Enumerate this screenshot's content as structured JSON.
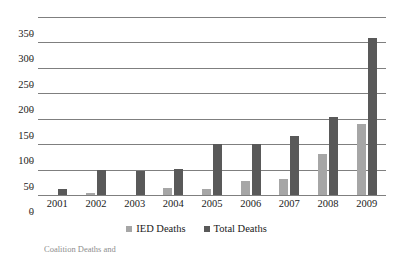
{
  "chart_data": {
    "type": "bar",
    "title": "",
    "subtitle": "",
    "xlabel": "",
    "ylabel": "",
    "categories": [
      "2001",
      "2002",
      "2003",
      "2004",
      "2005",
      "2006",
      "2007",
      "2008",
      "2009"
    ],
    "series": [
      {
        "name": "IED Deaths",
        "color": "#a6a6a6",
        "values": [
          0,
          3,
          0,
          14,
          12,
          28,
          32,
          81,
          139
        ]
      },
      {
        "name": "Total Deaths",
        "color": "#595959",
        "values": [
          12,
          49,
          48,
          52,
          100,
          100,
          117,
          154,
          308
        ]
      }
    ],
    "ylim": [
      0,
      350
    ],
    "yticks": [
      0,
      50,
      100,
      150,
      200,
      250,
      300,
      350
    ],
    "ytick_labels": [
      "0",
      "50",
      "100",
      "150",
      "200",
      "250",
      "300",
      "350"
    ],
    "grid": true,
    "grid_axis": "y",
    "legend_position": "bottom"
  },
  "legend": {
    "items": [
      {
        "label": "IED Deaths",
        "swatch_class": "ied"
      },
      {
        "label": "Total Deaths",
        "swatch_class": "total"
      }
    ]
  },
  "caption": {
    "text": "Coalition Deaths and"
  },
  "colors": {
    "ied": "#a6a6a6",
    "total": "#595959",
    "gridline": "#7f7f7f",
    "text": "#1a1a1a",
    "background": "#ffffff"
  }
}
